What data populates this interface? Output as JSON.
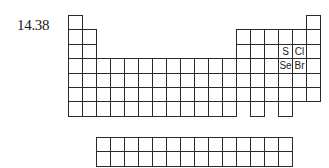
{
  "figure_label": "14.38",
  "table": {
    "main_origin": {
      "x": 68,
      "y": 15
    },
    "cell_w": 14,
    "cell_h": 14.4,
    "rows": [
      {
        "period": 1,
        "cols": [
          1,
          18
        ]
      },
      {
        "period": 2,
        "cols": [
          1,
          2,
          13,
          14,
          15,
          16,
          17,
          18
        ]
      },
      {
        "period": 3,
        "cols": [
          1,
          2,
          13,
          14,
          15,
          16,
          17,
          18
        ]
      },
      {
        "period": 4,
        "cols": [
          1,
          2,
          3,
          4,
          5,
          6,
          7,
          8,
          9,
          10,
          11,
          12,
          13,
          14,
          15,
          16,
          17,
          18
        ]
      },
      {
        "period": 5,
        "cols": [
          1,
          2,
          3,
          4,
          5,
          6,
          7,
          8,
          9,
          10,
          11,
          12,
          13,
          14,
          15,
          16,
          17,
          18
        ]
      },
      {
        "period": 6,
        "cols": [
          1,
          2,
          3,
          4,
          5,
          6,
          7,
          8,
          9,
          10,
          11,
          12,
          13,
          14,
          15,
          16,
          17,
          18
        ]
      },
      {
        "period": 7,
        "cols": [
          1,
          2,
          3,
          4,
          5,
          6,
          7,
          8,
          9,
          10,
          11,
          12,
          14,
          16
        ]
      }
    ],
    "f_block": {
      "origin": {
        "x": 96,
        "y": 137
      },
      "rows": 2,
      "cols": 14
    },
    "labeled_elements": [
      {
        "symbol": "S",
        "period": 3,
        "group": 16
      },
      {
        "symbol": "Cl",
        "period": 3,
        "group": 17
      },
      {
        "symbol": "Se",
        "period": 4,
        "group": 16
      },
      {
        "symbol": "Br",
        "period": 4,
        "group": 17
      }
    ]
  }
}
